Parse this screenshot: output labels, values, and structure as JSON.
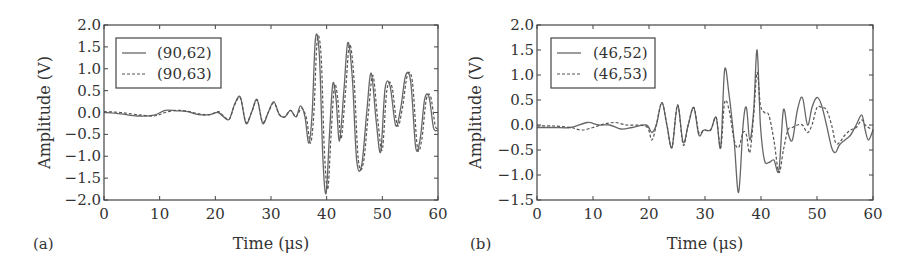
{
  "chart_data": [
    {
      "type": "line",
      "panel_label": "(a)",
      "title": "",
      "xlabel": "Time (μs)",
      "ylabel": "Amplitude (V)",
      "xlim": [
        0,
        60
      ],
      "ylim": [
        -2.0,
        2.0
      ],
      "xticks": [
        "0",
        "10",
        "20",
        "30",
        "40",
        "50",
        "60"
      ],
      "yticks": [
        "2.0",
        "1.5",
        "1.0",
        "0.5",
        "0.0",
        "−0.5",
        "−1.0",
        "−1.5",
        "−2.0"
      ],
      "grid": false,
      "legend_position": "upper left",
      "series": [
        {
          "name": "(90,62)",
          "style": "solid",
          "x": [
            0,
            3,
            6,
            9,
            11,
            13,
            15,
            17,
            19,
            20.5,
            21.5,
            22.5,
            23.5,
            24.5,
            25.5,
            26.5,
            27.5,
            28.5,
            29.5,
            30.5,
            31.5,
            32.5,
            33.5,
            34.5,
            35.3,
            36.1,
            36.8,
            37.4,
            38.0,
            38.7,
            39.3,
            39.9,
            40.5,
            41.1,
            41.7,
            42.3,
            43.1,
            43.8,
            44.6,
            45.4,
            46.3,
            47.2,
            48.0,
            48.9,
            49.7,
            50.5,
            51.4,
            52.4,
            53.3,
            54.2,
            55.1,
            56.0,
            56.8,
            57.6,
            58.4,
            59.2,
            60
          ],
          "y": [
            0.0,
            -0.03,
            -0.08,
            -0.06,
            0.05,
            0.04,
            0.02,
            -0.05,
            -0.05,
            0.0,
            -0.1,
            -0.15,
            0.2,
            0.35,
            -0.25,
            0.0,
            0.3,
            -0.25,
            0.0,
            0.25,
            -0.05,
            -0.1,
            0.05,
            -0.1,
            0.15,
            -0.1,
            -0.7,
            0.0,
            1.7,
            1.3,
            -1.0,
            -1.85,
            -0.5,
            0.65,
            0.3,
            -0.65,
            0.5,
            1.6,
            0.8,
            -1.1,
            -1.2,
            0.0,
            0.9,
            -0.2,
            -0.9,
            0.55,
            0.6,
            -0.3,
            0.1,
            0.85,
            0.7,
            -0.8,
            -0.6,
            0.3,
            0.35,
            -0.35,
            -0.4
          ]
        },
        {
          "name": "(90,63)",
          "style": "dashed",
          "x": [
            0,
            3,
            6,
            9,
            11,
            13,
            15,
            17,
            19,
            20.5,
            21.5,
            22.5,
            23.5,
            24.5,
            25.5,
            26.5,
            27.5,
            28.5,
            29.5,
            30.5,
            31.5,
            32.5,
            33.5,
            34.5,
            35.5,
            36.4,
            37.1,
            37.7,
            38.3,
            39.0,
            39.6,
            40.2,
            40.8,
            41.4,
            42.0,
            42.6,
            43.4,
            44.1,
            44.9,
            45.7,
            46.6,
            47.5,
            48.3,
            49.2,
            50.0,
            50.8,
            51.7,
            52.7,
            53.6,
            54.5,
            55.4,
            56.3,
            57.1,
            57.9,
            58.7,
            59.5,
            60
          ],
          "y": [
            0.02,
            0.0,
            -0.05,
            -0.08,
            0.0,
            0.05,
            0.03,
            -0.03,
            -0.05,
            0.02,
            -0.08,
            -0.15,
            0.18,
            0.33,
            -0.22,
            0.0,
            0.28,
            -0.22,
            0.0,
            0.22,
            -0.05,
            -0.1,
            0.05,
            -0.1,
            0.1,
            -0.15,
            -0.7,
            0.0,
            1.65,
            1.3,
            -0.9,
            -1.75,
            -0.5,
            0.6,
            0.3,
            -0.6,
            0.5,
            1.55,
            0.8,
            -1.1,
            -1.15,
            0.0,
            0.85,
            -0.2,
            -0.85,
            0.5,
            0.6,
            -0.3,
            0.1,
            0.85,
            0.7,
            -0.8,
            -0.6,
            0.3,
            0.35,
            -0.3,
            -0.35
          ]
        }
      ]
    },
    {
      "type": "line",
      "panel_label": "(b)",
      "title": "",
      "xlabel": "Time (μs)",
      "ylabel": "Amplitude (V)",
      "xlim": [
        0,
        60
      ],
      "ylim": [
        -1.5,
        2.0
      ],
      "xticks": [
        "0",
        "10",
        "20",
        "30",
        "40",
        "50",
        "60"
      ],
      "yticks": [
        "2.0",
        "1.5",
        "1.0",
        "0.5",
        "0.0",
        "−0.5",
        "−1.0",
        "−1.5"
      ],
      "grid": false,
      "legend_position": "upper left",
      "series": [
        {
          "name": "(46,52)",
          "style": "solid",
          "x": [
            0,
            3,
            6,
            9,
            11,
            13,
            15,
            17,
            19.5,
            20.5,
            21.3,
            22.3,
            23.2,
            24.1,
            25.1,
            26.1,
            27.0,
            28.0,
            28.9,
            29.8,
            31.0,
            32.0,
            32.8,
            33.5,
            34.3,
            35.2,
            36.0,
            36.8,
            37.4,
            38.0,
            38.7,
            39.3,
            39.9,
            40.6,
            41.4,
            42.3,
            43.2,
            44.0,
            44.8,
            45.6,
            46.5,
            47.4,
            48.3,
            49.1,
            50.0,
            50.8,
            51.7,
            52.6,
            53.3,
            54.0,
            55.0,
            56.0,
            57.0,
            58.0,
            58.6,
            59.2,
            60
          ],
          "y": [
            -0.05,
            -0.05,
            -0.05,
            0.05,
            0.0,
            0.0,
            -0.08,
            -0.05,
            0.0,
            -0.15,
            0.0,
            0.45,
            0.0,
            -0.45,
            0.4,
            -0.35,
            0.0,
            0.35,
            -0.2,
            -0.1,
            -0.1,
            0.15,
            -0.45,
            1.1,
            0.6,
            -0.3,
            -1.35,
            0.0,
            0.35,
            -0.3,
            0.3,
            1.5,
            0.0,
            -0.7,
            -0.75,
            -0.7,
            -0.9,
            0.3,
            -0.15,
            -0.3,
            0.3,
            0.55,
            0.0,
            0.35,
            0.55,
            0.4,
            0.0,
            -0.45,
            -0.55,
            -0.4,
            -0.3,
            -0.2,
            0.0,
            0.2,
            -0.1,
            -0.3,
            -0.1
          ]
        },
        {
          "name": "(46,53)",
          "style": "dashed",
          "x": [
            0,
            3,
            6,
            8,
            10,
            12,
            14,
            16,
            19.5,
            20.5,
            21.3,
            22.3,
            23.2,
            24.1,
            25.1,
            26.1,
            27.0,
            28.0,
            28.9,
            29.8,
            31.0,
            32.0,
            32.8,
            33.5,
            34.3,
            35.2,
            36.0,
            36.8,
            37.4,
            38.0,
            38.7,
            39.3,
            39.9,
            40.6,
            41.4,
            42.3,
            43.2,
            44.0,
            44.8,
            45.6,
            46.5,
            47.4,
            48.3,
            49.1,
            50.0,
            50.8,
            51.7,
            52.6,
            53.3,
            54.0,
            55.0,
            56.0,
            57.0,
            58.0,
            58.6,
            59.2,
            60
          ],
          "y": [
            -0.02,
            -0.02,
            -0.05,
            -0.1,
            -0.05,
            0.02,
            0.05,
            0.0,
            -0.03,
            -0.3,
            0.0,
            0.45,
            0.0,
            -0.45,
            0.4,
            -0.4,
            0.0,
            0.35,
            -0.15,
            -0.1,
            -0.1,
            0.15,
            -0.45,
            0.45,
            0.3,
            -0.3,
            -0.45,
            -0.15,
            -0.2,
            -0.55,
            0.2,
            1.05,
            0.4,
            0.25,
            0.2,
            -0.3,
            -0.95,
            -0.5,
            -0.1,
            -0.05,
            0.0,
            0.0,
            -0.15,
            0.0,
            0.35,
            0.35,
            0.3,
            0.0,
            -0.35,
            -0.35,
            -0.2,
            -0.1,
            -0.05,
            0.1,
            0.0,
            -0.05,
            -0.1
          ]
        }
      ]
    }
  ]
}
